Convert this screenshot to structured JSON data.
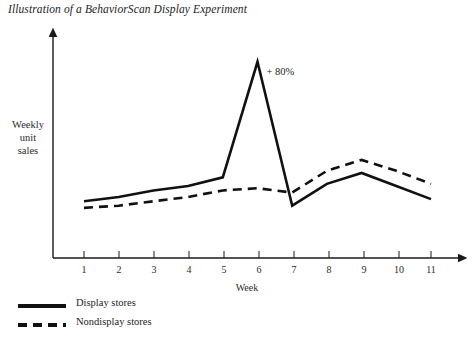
{
  "chart_data": {
    "type": "line",
    "title": "Illustration of a BehaviorScan Display Experiment",
    "xlabel": "Week",
    "ylabel": "Weekly unit sales",
    "ylabel_lines": [
      "Weekly",
      "unit",
      "sales"
    ],
    "x": [
      1,
      2,
      3,
      4,
      5,
      6,
      7,
      8,
      9,
      10,
      11
    ],
    "categories": [
      "1",
      "2",
      "3",
      "4",
      "5",
      "6",
      "7",
      "8",
      "9",
      "10",
      "11"
    ],
    "xlim": [
      1,
      11
    ],
    "ylim": [
      0,
      100
    ],
    "grid": false,
    "legend_position": "below-left",
    "series": [
      {
        "name": "Display stores",
        "style": "solid",
        "color": "#111111",
        "values": [
          26,
          28,
          31,
          33,
          37,
          90,
          24,
          34,
          39,
          33,
          27
        ]
      },
      {
        "name": "Nondisplay stores",
        "style": "dashed",
        "color": "#111111",
        "values": [
          23,
          24,
          26,
          28,
          31,
          32,
          30,
          40,
          45,
          40,
          34
        ]
      }
    ],
    "annotations": [
      {
        "text": "+ 80%",
        "x": 6,
        "y": 90,
        "name": "lift-annotation"
      }
    ]
  },
  "legend": {
    "items": [
      {
        "label": "Display stores",
        "style": "solid"
      },
      {
        "label": "Nondisplay stores",
        "style": "dashed"
      }
    ]
  }
}
